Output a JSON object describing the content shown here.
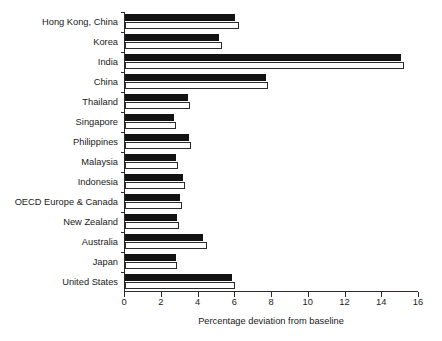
{
  "chart_data": {
    "type": "bar",
    "orientation": "horizontal",
    "title": "",
    "xlabel": "Percentage deviation from baseline",
    "ylabel": "",
    "xlim": [
      0,
      16
    ],
    "xticks": [
      0,
      2,
      4,
      6,
      8,
      10,
      12,
      14,
      16
    ],
    "xtick_labels": [
      "0",
      "2",
      "4",
      "6",
      "8",
      "10",
      "12",
      "14",
      "16"
    ],
    "grid": false,
    "legend": null,
    "categories": [
      "Hong Kong, China",
      "Korea",
      "India",
      "China",
      "Thailand",
      "Singapore",
      "Philippines",
      "Malaysia",
      "Indonesia",
      "OECD Europe & Canada",
      "New Zealand",
      "Australia",
      "Japan",
      "United States"
    ],
    "series": [
      {
        "name": "series-1",
        "style": "filled-black",
        "color": "#131313",
        "values": [
          6.0,
          5.1,
          15.0,
          7.65,
          3.45,
          2.65,
          3.5,
          2.8,
          3.15,
          3.0,
          2.85,
          4.25,
          2.75,
          5.8
        ]
      },
      {
        "name": "series-2",
        "style": "outlined-white",
        "color": "#ffffff",
        "edgecolor": "#2b2b2b",
        "values": [
          6.2,
          5.3,
          15.2,
          7.8,
          3.55,
          2.75,
          3.6,
          2.9,
          3.25,
          3.1,
          2.95,
          4.45,
          2.85,
          6.0
        ]
      }
    ]
  }
}
